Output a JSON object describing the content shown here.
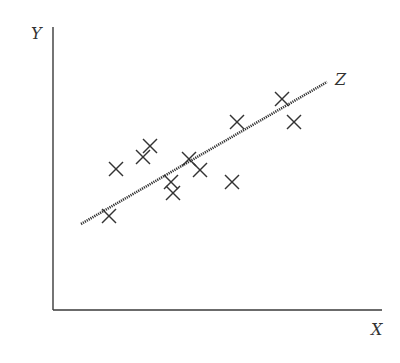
{
  "chart_data": {
    "type": "scatter",
    "title": "",
    "xlabel": "X",
    "ylabel": "Y",
    "line_label": "Z",
    "grid": false,
    "legend": "none",
    "marker": "x",
    "xlim": [
      0,
      330
    ],
    "ylim": [
      0,
      285
    ],
    "points": [
      {
        "x": 56,
        "y": 94
      },
      {
        "x": 63,
        "y": 141
      },
      {
        "x": 90,
        "y": 153
      },
      {
        "x": 97,
        "y": 164
      },
      {
        "x": 118,
        "y": 128
      },
      {
        "x": 120,
        "y": 117
      },
      {
        "x": 136,
        "y": 151
      },
      {
        "x": 147,
        "y": 140
      },
      {
        "x": 179,
        "y": 128
      },
      {
        "x": 184,
        "y": 188
      },
      {
        "x": 229,
        "y": 211
      },
      {
        "x": 241,
        "y": 188
      }
    ],
    "fit_line": {
      "x1": 28,
      "y1": 86,
      "x2": 274,
      "y2": 228,
      "style": "dotted"
    }
  },
  "labels": {
    "y_axis": "Y",
    "x_axis": "X",
    "line": "Z"
  },
  "colors": {
    "ink": "#333333",
    "axis": "#3a3a3a",
    "background": "#ffffff"
  }
}
